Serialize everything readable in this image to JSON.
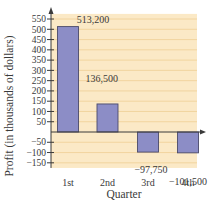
{
  "chart_data": {
    "type": "bar",
    "title": "",
    "xlabel": "Quarter",
    "ylabel": "Profit (in thousands of dollars)",
    "categories": [
      "1st",
      "2nd",
      "3rd",
      "4th"
    ],
    "values": [
      513.2,
      136.5,
      -97.75,
      -101.5
    ],
    "value_labels": [
      "513,200",
      "136,500",
      "−97,750",
      "−101,500"
    ],
    "yticks": [
      550,
      500,
      450,
      400,
      350,
      300,
      250,
      200,
      150,
      100,
      50,
      -50,
      -100,
      -150
    ],
    "ytick_labels": [
      "550",
      "500",
      "450",
      "400",
      "350",
      "300",
      "250",
      "200",
      "150",
      "100",
      "50",
      "−50",
      "−100",
      "−150"
    ],
    "ylim": [
      -175,
      575
    ],
    "grid": true,
    "legend": null,
    "colors": {
      "bar_fill": "#8c8dc6",
      "bar_stroke": "#4a4a6a",
      "plot_background": "#fbe9c6",
      "gridline": "#efcf95",
      "axis": "#3a3a3a"
    }
  }
}
